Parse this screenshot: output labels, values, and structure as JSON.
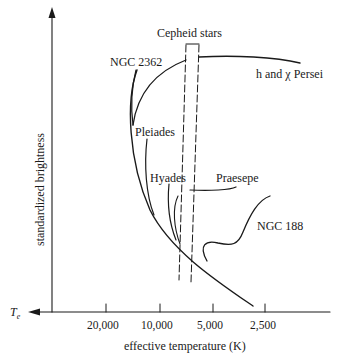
{
  "diagram": {
    "title": "",
    "y_axis": {
      "label": "standardized brightness"
    },
    "x_axis": {
      "label": "effective temperature (K)",
      "arrow_label": "T",
      "arrow_label_sub": "e",
      "ticks": [
        "20,000",
        "10,000",
        "5,000",
        "2,500"
      ]
    },
    "strip": {
      "label": "Cepheid stars"
    },
    "clusters": [
      {
        "name": "NGC 2362"
      },
      {
        "name": "h and χ Persei"
      },
      {
        "name": "Pleiades"
      },
      {
        "name": "Hyades"
      },
      {
        "name": "Praesepe"
      },
      {
        "name": "NGC 188"
      }
    ],
    "colors": {
      "ink": "#1a1a1a",
      "background": "#ffffff"
    }
  }
}
